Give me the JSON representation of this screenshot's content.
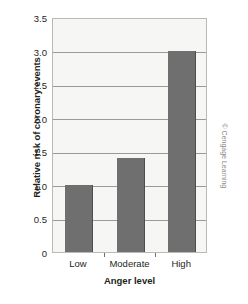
{
  "chart_data": {
    "type": "bar",
    "title": "",
    "subtitle": "",
    "categories": [
      "Low",
      "Moderate",
      "High"
    ],
    "values": [
      1.0,
      1.4,
      3.0
    ],
    "series": [
      {
        "name": "Relative risk of coronary events",
        "values": [
          1.0,
          1.4,
          3.0
        ]
      }
    ],
    "xlabel": "Anger level",
    "ylabel": "Relative risk of coronary events",
    "ylim": [
      0,
      3.5
    ],
    "yticks": [
      "0",
      "0.5",
      "1.0",
      "1.5",
      "2.0",
      "2.5",
      "3.0",
      "3.5"
    ],
    "ytick_values": [
      0,
      0.5,
      1.0,
      1.5,
      2.0,
      2.5,
      3.0,
      3.5
    ],
    "grid": true,
    "grid_axis": "y",
    "legend": false,
    "legend_position": "none",
    "bar_color": "#6f6f6f",
    "bar_edge_color": "#4e4e4e",
    "plot_background": "#f6f6f4",
    "grid_color": "#9a9a96",
    "frame_color": "#b9b9b5",
    "text_color": "#231f20",
    "annotations": []
  },
  "credit": {
    "text": "© Cengage Learning",
    "color": "#8b8b8b"
  }
}
